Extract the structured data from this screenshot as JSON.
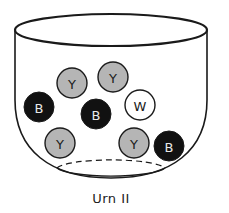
{
  "figure": {
    "caption": "Urn II",
    "colors": {
      "outline": "#1a1a1a",
      "yellow_fill": "#b5b5b5",
      "black_fill": "#111111",
      "white_fill": "#ffffff",
      "label_dark": "#1a1a1a",
      "label_light": "#e8e8e8"
    },
    "balls": [
      {
        "label": "Y",
        "color": "yellow",
        "cx": 72,
        "cy": 83
      },
      {
        "label": "Y",
        "color": "yellow",
        "cx": 113,
        "cy": 77
      },
      {
        "label": "B",
        "color": "black",
        "cx": 39,
        "cy": 107
      },
      {
        "label": "B",
        "color": "black",
        "cx": 96,
        "cy": 114
      },
      {
        "label": "W",
        "color": "white",
        "cx": 140,
        "cy": 105
      },
      {
        "label": "Y",
        "color": "yellow",
        "cx": 60,
        "cy": 143
      },
      {
        "label": "Y",
        "color": "yellow",
        "cx": 134,
        "cy": 143
      },
      {
        "label": "B",
        "color": "black",
        "cx": 169,
        "cy": 146
      }
    ],
    "counts": {
      "Y": 4,
      "B": 3,
      "W": 1
    }
  }
}
